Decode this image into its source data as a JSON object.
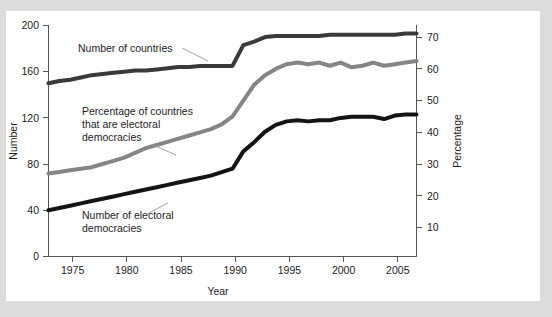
{
  "figure": {
    "background_color": "#dcdcdc",
    "plot_background_color": "#ffffff"
  },
  "chart_data": {
    "type": "line",
    "title": "",
    "subtitle": "",
    "xlabel": "Year",
    "ylabel": "Number",
    "y2label": "Percentage",
    "xlim": [
      1973,
      2007
    ],
    "ylim": [
      0,
      200
    ],
    "y2lim": [
      0,
      75
    ],
    "grid": false,
    "legend": "inline-annotations",
    "xticks": [
      1975,
      1980,
      1985,
      1990,
      1995,
      2000,
      2005
    ],
    "xtick_labels": [
      "1975",
      "1980",
      "1985",
      "1990",
      "1995",
      "2000",
      "2005"
    ],
    "yticks": [
      0,
      40,
      80,
      120,
      160,
      200
    ],
    "ytick_labels": [
      "0",
      "40",
      "80",
      "120",
      "160",
      "200"
    ],
    "y2ticks": [
      10,
      20,
      30,
      40,
      50,
      60,
      70
    ],
    "y2tick_labels": [
      "10",
      "20",
      "30",
      "40",
      "50",
      "60",
      "70"
    ],
    "x": [
      1973,
      1974,
      1975,
      1976,
      1977,
      1978,
      1979,
      1980,
      1981,
      1982,
      1983,
      1984,
      1985,
      1986,
      1987,
      1988,
      1989,
      1990,
      1991,
      1992,
      1993,
      1994,
      1995,
      1996,
      1997,
      1998,
      1999,
      2000,
      2001,
      2002,
      2003,
      2004,
      2005,
      2006,
      2007
    ],
    "series": [
      {
        "name": "Number of countries",
        "axis": "left",
        "color": "#3a3a3a",
        "line_width": 4,
        "values": [
          150,
          152,
          153,
          155,
          157,
          158,
          159,
          160,
          161,
          161,
          162,
          163,
          164,
          164,
          165,
          165,
          165,
          165,
          183,
          186,
          190,
          191,
          191,
          191,
          191,
          191,
          192,
          192,
          192,
          192,
          192,
          192,
          192,
          193,
          193
        ]
      },
      {
        "name": "Percentage of countries that are electoral democracies",
        "axis": "right",
        "color": "#858585",
        "line_width": 4,
        "values": [
          27,
          27.5,
          28,
          28.5,
          29,
          30,
          31,
          32,
          33.5,
          35,
          36,
          37,
          38,
          39,
          40,
          41,
          42.5,
          45,
          50,
          55,
          58,
          60,
          61.5,
          62,
          61.5,
          62,
          61,
          62,
          60.5,
          61,
          62,
          61,
          61.5,
          62,
          62.5
        ]
      },
      {
        "name": "Number of electoral democracies",
        "axis": "left",
        "color": "#141414",
        "line_width": 4,
        "values": [
          40,
          42,
          44,
          46,
          48,
          50,
          52,
          54,
          56,
          58,
          60,
          62,
          64,
          66,
          68,
          70,
          73,
          76,
          91,
          99,
          108,
          114,
          117,
          118,
          117,
          118,
          118,
          120,
          121,
          121,
          121,
          119,
          122,
          123,
          123
        ]
      }
    ],
    "annotations": [
      {
        "name": "Number of countries",
        "text_lines": [
          "Number of countries"
        ],
        "text_x": 78,
        "text_y": 52,
        "leader": [
          [
            180,
            50
          ],
          [
            205,
            62
          ]
        ]
      },
      {
        "name": "Percentage of countries that are electoral democracies",
        "text_lines": [
          "Percentage of countries",
          "that are electoral",
          "democracies"
        ],
        "text_x": 82,
        "text_y": 115,
        "leader": [
          [
            155,
            148
          ],
          [
            178,
            158
          ]
        ]
      },
      {
        "name": "Number of electoral democracies",
        "text_lines": [
          "Number of electoral",
          "democracies"
        ],
        "text_x": 82,
        "text_y": 218,
        "leader": [
          [
            148,
            216
          ],
          [
            170,
            206
          ]
        ]
      }
    ]
  }
}
